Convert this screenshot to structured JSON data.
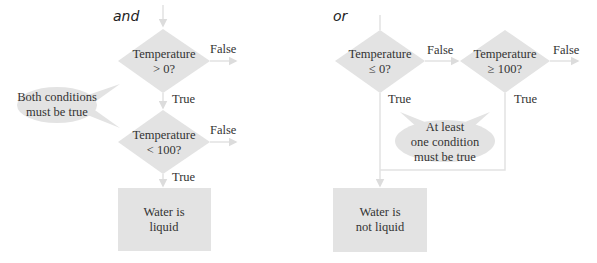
{
  "diagrams": [
    {
      "title": "and",
      "decisions": [
        {
          "line1": "Temperature",
          "line2": "> 0?",
          "false_label": "False",
          "true_label": "True"
        },
        {
          "line1": "Temperature",
          "line2": "< 100?",
          "false_label": "False",
          "true_label": "True"
        }
      ],
      "callout": {
        "line1": "Both conditions",
        "line2": "must be true"
      },
      "result": {
        "line1": "Water is",
        "line2": "liquid"
      }
    },
    {
      "title": "or",
      "decisions": [
        {
          "line1": "Temperature",
          "line2": "≤ 0?",
          "false_label": "False",
          "true_label": "True"
        },
        {
          "line1": "Temperature",
          "line2": "≥ 100?",
          "false_label": "False",
          "true_label": "True"
        }
      ],
      "callout": {
        "line1": "At least",
        "line2": "one condition",
        "line3": "must be true"
      },
      "result": {
        "line1": "Water is",
        "line2": "not liquid"
      }
    }
  ],
  "colors": {
    "shape_fill": "#e3e3e3",
    "line": "#e0e0e0",
    "text": "#333333"
  }
}
